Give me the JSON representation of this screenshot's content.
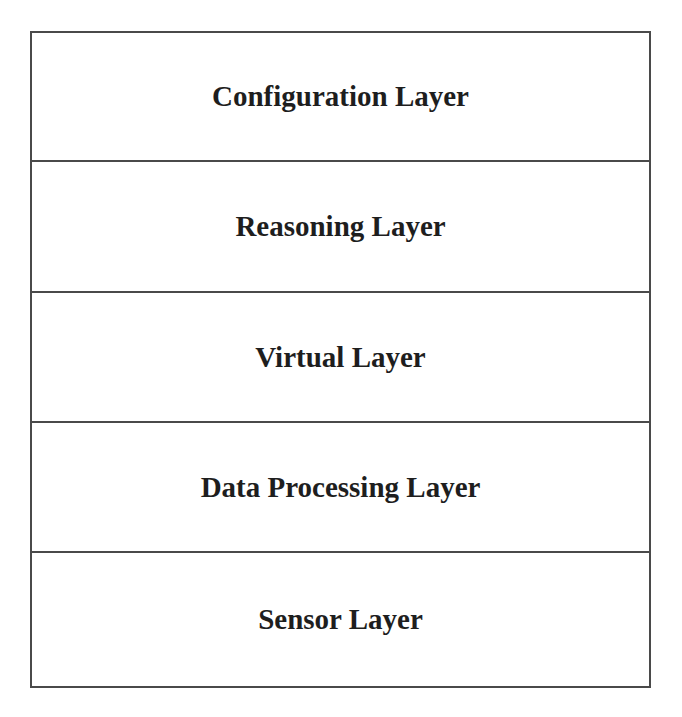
{
  "diagram": {
    "type": "layered-stack",
    "layers": [
      {
        "label": "Configuration Layer",
        "height": 130
      },
      {
        "label": "Reasoning Layer",
        "height": 131
      },
      {
        "label": "Virtual Layer",
        "height": 130
      },
      {
        "label": "Data Processing Layer",
        "height": 130
      },
      {
        "label": "Sensor Layer",
        "height": 132
      }
    ],
    "colors": {
      "border": "#4a4a4a",
      "text": "#1e1e1e",
      "background": "#ffffff"
    }
  }
}
